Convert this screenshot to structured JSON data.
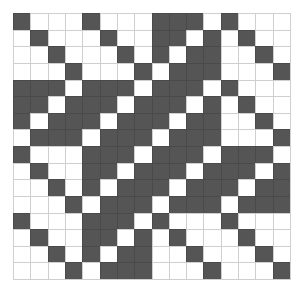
{
  "grid": {
    "rows": 16,
    "cols": 16,
    "colors": {
      "filled": "#555555",
      "empty": "#ffffff",
      "line": "#cfcfcf"
    },
    "cells": [
      [
        1,
        0,
        0,
        0,
        1,
        0,
        0,
        0,
        1,
        1,
        1,
        0,
        1,
        0,
        0,
        0
      ],
      [
        0,
        1,
        0,
        0,
        0,
        1,
        0,
        0,
        1,
        1,
        0,
        1,
        0,
        1,
        0,
        0
      ],
      [
        0,
        0,
        1,
        0,
        0,
        0,
        1,
        0,
        1,
        0,
        1,
        1,
        0,
        0,
        1,
        0
      ],
      [
        0,
        0,
        0,
        1,
        0,
        0,
        0,
        1,
        0,
        1,
        1,
        1,
        0,
        0,
        0,
        1
      ],
      [
        1,
        1,
        1,
        0,
        1,
        1,
        1,
        0,
        1,
        1,
        1,
        0,
        1,
        0,
        0,
        0
      ],
      [
        1,
        1,
        0,
        1,
        1,
        1,
        0,
        1,
        1,
        1,
        0,
        1,
        0,
        1,
        0,
        0
      ],
      [
        1,
        0,
        1,
        1,
        1,
        0,
        1,
        1,
        1,
        0,
        1,
        1,
        0,
        0,
        1,
        0
      ],
      [
        0,
        1,
        1,
        1,
        0,
        1,
        1,
        1,
        0,
        1,
        1,
        1,
        0,
        0,
        0,
        1
      ],
      [
        1,
        0,
        0,
        0,
        1,
        1,
        1,
        0,
        1,
        1,
        1,
        0,
        1,
        1,
        1,
        0
      ],
      [
        0,
        1,
        0,
        0,
        1,
        1,
        0,
        1,
        1,
        1,
        0,
        1,
        1,
        1,
        0,
        1
      ],
      [
        0,
        0,
        1,
        0,
        1,
        0,
        1,
        1,
        1,
        0,
        1,
        1,
        1,
        0,
        1,
        1
      ],
      [
        0,
        0,
        0,
        1,
        0,
        1,
        1,
        1,
        0,
        1,
        1,
        1,
        0,
        1,
        1,
        1
      ],
      [
        1,
        0,
        0,
        0,
        1,
        1,
        1,
        0,
        1,
        0,
        0,
        0,
        1,
        0,
        0,
        0
      ],
      [
        0,
        1,
        0,
        0,
        1,
        1,
        0,
        1,
        0,
        1,
        0,
        0,
        0,
        1,
        0,
        0
      ],
      [
        0,
        0,
        1,
        0,
        1,
        0,
        1,
        1,
        0,
        0,
        1,
        0,
        0,
        0,
        1,
        0
      ],
      [
        0,
        0,
        0,
        1,
        0,
        1,
        1,
        1,
        0,
        0,
        0,
        1,
        0,
        0,
        0,
        1
      ]
    ]
  }
}
